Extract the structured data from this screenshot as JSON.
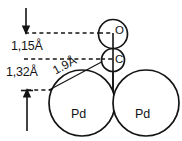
{
  "figure": {
    "background_color": "#ffffff",
    "stroke_color": "#141414"
  },
  "atoms": [
    {
      "id": "oxygen",
      "label": "O",
      "cx": 113,
      "cy": 34,
      "r": 14.5
    },
    {
      "id": "carbon",
      "label": "C",
      "cx": 113,
      "cy": 60,
      "r": 11.5
    },
    {
      "id": "palladium-left",
      "label": "Pd",
      "cx": 82,
      "cy": 103,
      "r": 33
    },
    {
      "id": "palladium-right",
      "label": "Pd",
      "cx": 146,
      "cy": 103,
      "r": 33
    }
  ],
  "dimensions": [
    {
      "id": "c-o-distance",
      "value": "1,15Å",
      "x": 11,
      "y": 47
    },
    {
      "id": "pd-c-height",
      "value": "1,32Å",
      "x": 6,
      "y": 73
    },
    {
      "id": "pd-c-bond-radius",
      "value": "1.9Å",
      "x": 54,
      "y": 72,
      "rotation": 40
    }
  ],
  "guides": {
    "dashed_lines": [
      {
        "id": "guide-top",
        "x1": 25,
        "y1": 33,
        "x2": 112,
        "y2": 33
      },
      {
        "id": "guide-middle",
        "x1": 24,
        "y1": 59,
        "x2": 112,
        "y2": 59
      },
      {
        "id": "guide-bottom",
        "x1": 27,
        "y1": 90,
        "x2": 112,
        "y2": 90
      }
    ],
    "arrows": [
      {
        "id": "arrow-down-top",
        "direction": "down",
        "x": 26,
        "y1": 8,
        "y2": 33
      },
      {
        "id": "arrow-up-bottom",
        "direction": "up",
        "x": 27,
        "y1": 130,
        "y2": 90
      }
    ],
    "molecular_axis": {
      "id": "co-axis",
      "x": 113,
      "y1": 33,
      "y2": 92
    },
    "radius_line": {
      "id": "radius-line",
      "x1": 49,
      "y1": 90,
      "x2": 110,
      "y2": 58
    }
  }
}
